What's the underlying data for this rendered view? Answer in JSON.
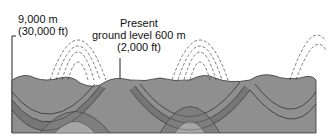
{
  "diagram": {
    "type": "geologic-cross-section",
    "labels": {
      "height_top_m": "9,000 m",
      "height_top_ft": "(30,000 ft)",
      "ground_line1": "Present",
      "ground_line2": "ground level 600 m",
      "ground_line3": "(2,000 ft)"
    },
    "colors": {
      "layer_dark": "#7a7a7a",
      "layer_mid": "#9a9a9a",
      "layer_light": "#b8b8b8",
      "outline": "#333333",
      "dashed": "#444444"
    }
  }
}
